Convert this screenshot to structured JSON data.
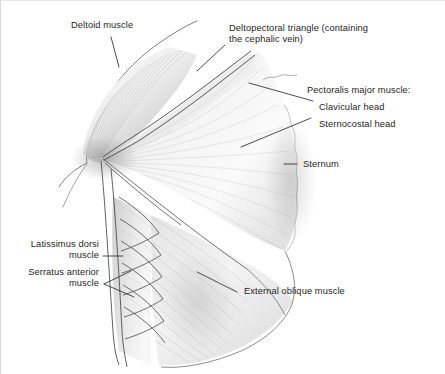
{
  "figure": {
    "background_color": "#ffffff",
    "ink_color": "#262626",
    "border_color": "#d8d8d8"
  },
  "labels": {
    "deltoid": "Deltoid muscle",
    "deltopectoral_line1": "Deltopectoral triangle (containing",
    "deltopectoral_line2": "the cephalic vein)",
    "pectoralis_heading": "Pectoralis major muscle:",
    "clavicular_head": "Clavicular head",
    "sternocostal_head": "Sternocostal head",
    "sternum": "Sternum",
    "latissimus_line1": "Latissimus dorsi",
    "latissimus_line2": "muscle",
    "serratus_line1": "Serratus anterior",
    "serratus_line2": "muscle",
    "external_oblique": "External oblique muscle"
  }
}
